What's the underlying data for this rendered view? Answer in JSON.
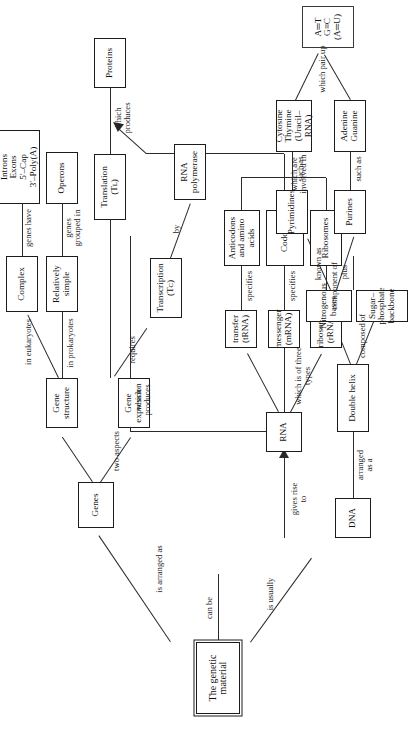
{
  "diagram": {
    "type": "concept-map",
    "orientation": "rotated-90-ccw"
  },
  "nodes": {
    "root": "The genetic\nmaterial",
    "dna": "DNA",
    "rna": "RNA",
    "genes": "Genes",
    "gene_expression": "Gene\nexpression",
    "gene_structure": "Gene\nstructure",
    "transcription": "Transcription\n(Tᴄ)",
    "translation": "Translation\n(Tʟ)",
    "rna_polymerase": "RNA\npolymerase",
    "proteins": "Proteins",
    "relatively_simple": "Relatively\nsimple",
    "complex": "Complex",
    "operons": "Operons",
    "introns_exons": "Introns\nExons\n5'–Cap\n3'–Poly(A)",
    "ribosomal_rna": "ribosomal\n(rRNA)",
    "messenger_rna": "messenger\n(mRNA)",
    "transfer_rna": "transfer\n(tRNA)",
    "ribosomes": "Ribosomes",
    "codons": "Codons",
    "anticodons": "Anticodons\nand amino\nacids",
    "double_helix": "Double helix",
    "sugar_phosphate": "Sugar–phosphate\nbackbone",
    "nitrogenous_bases": "Nitrogenous\nbases",
    "purines": "Purines",
    "pyrimidines": "Pyrimidines",
    "adenine_guanine": "Adenine\nGuanine",
    "cytosine_thymine": "Cytosine\nThymine\n(Uracil–RNA)",
    "base_pairs": "A═T\nG≡C\n(A═U)"
  },
  "links": {
    "is_usually": "is usually",
    "is_arranged_as": "is arranged as",
    "can_be": "can be",
    "gives_rise_to": "gives rise\nto",
    "two_aspects": "two aspects",
    "requires": "requires",
    "by": "by",
    "which_produces_proteins": "which\nproduces",
    "which_produces_rna": "which\nproduces",
    "in_prokaryotes": "in prokaryotes",
    "in_eukaryotes": "in eukaryotes",
    "genes_grouped_in": "genes\ngrouped in",
    "genes_have": "genes have",
    "which_is_of_three_types": "which is of three types",
    "component_of": "component of",
    "specifies_mrna": "specifies",
    "specifies_trna": "specifies",
    "which_are_involved_in": "which are\ninvolved in",
    "arranged_as_a": "arranged\nas a",
    "composed_of": "composed of",
    "plus": "plus",
    "known_as": "known as",
    "such_as_purines": "such as",
    "such_as_pyrimidines": "such as",
    "which_pair_up": "which pair up"
  },
  "colors": {
    "ink": "#1c1c1c",
    "line": "#2a2a2a",
    "paper": "#ffffff"
  }
}
